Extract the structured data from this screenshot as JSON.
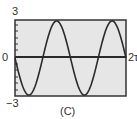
{
  "chart_data": {
    "type": "line",
    "title": "",
    "caption": "(C)",
    "xlabel": "",
    "ylabel": "",
    "xlim": [
      0,
      6.2832
    ],
    "ylim": [
      -3,
      3
    ],
    "x_tick_labels": {
      "left": "0",
      "right": "2π"
    },
    "y_tick_labels": {
      "top": "3",
      "bottom": "−3"
    },
    "grid": false,
    "series": [
      {
        "name": "y = -3 sin(2x)",
        "x": [
          0,
          0.785,
          1.571,
          2.356,
          3.142,
          3.927,
          4.712,
          5.498,
          6.283
        ],
        "y": [
          0,
          -3,
          0,
          3,
          0,
          -3,
          0,
          3,
          0
        ]
      }
    ]
  },
  "labels": {
    "y_top": "3",
    "y_bottom": "−3",
    "x_left": "0",
    "x_right": "2τ",
    "caption": "(C)"
  },
  "colors": {
    "plot_background": "#e6e6e6",
    "frame": "#333333",
    "curve": "#2a2a2a"
  }
}
